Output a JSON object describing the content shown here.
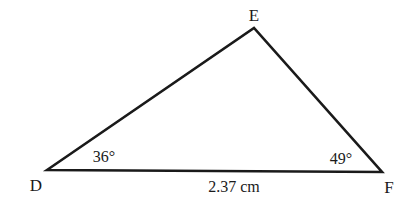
{
  "diagram": {
    "type": "triangle",
    "vertices": {
      "D": {
        "label": "D"
      },
      "E": {
        "label": "E"
      },
      "F": {
        "label": "F"
      }
    },
    "angles": {
      "D": "36°",
      "F": "49°"
    },
    "sides": {
      "DF": "2.37 cm"
    },
    "stroke_color": "#1a1a1a",
    "background": "#ffffff"
  }
}
